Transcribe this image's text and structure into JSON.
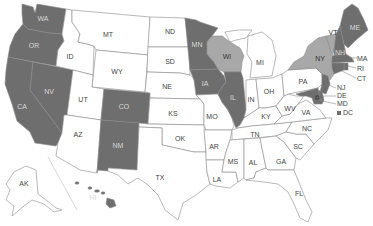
{
  "map": {
    "title": "",
    "colors": {
      "dark": "#6e6e6e",
      "light": "#a8a8a8",
      "none": "#ffffff",
      "label_on_dark": "#d8d8d8",
      "label_on_light": "#333333",
      "label_on_white": "#444444"
    },
    "legend": [],
    "states": [
      {
        "abbr": "WA",
        "shade": "dark"
      },
      {
        "abbr": "OR",
        "shade": "dark"
      },
      {
        "abbr": "CA",
        "shade": "dark"
      },
      {
        "abbr": "NV",
        "shade": "dark"
      },
      {
        "abbr": "ID",
        "shade": "none"
      },
      {
        "abbr": "MT",
        "shade": "none"
      },
      {
        "abbr": "WY",
        "shade": "none"
      },
      {
        "abbr": "UT",
        "shade": "none"
      },
      {
        "abbr": "AZ",
        "shade": "none"
      },
      {
        "abbr": "CO",
        "shade": "dark"
      },
      {
        "abbr": "NM",
        "shade": "dark"
      },
      {
        "abbr": "ND",
        "shade": "none"
      },
      {
        "abbr": "SD",
        "shade": "none"
      },
      {
        "abbr": "NE",
        "shade": "none"
      },
      {
        "abbr": "KS",
        "shade": "none"
      },
      {
        "abbr": "OK",
        "shade": "none"
      },
      {
        "abbr": "TX",
        "shade": "none"
      },
      {
        "abbr": "MN",
        "shade": "dark"
      },
      {
        "abbr": "IA",
        "shade": "dark"
      },
      {
        "abbr": "MO",
        "shade": "none"
      },
      {
        "abbr": "AR",
        "shade": "none"
      },
      {
        "abbr": "LA",
        "shade": "none"
      },
      {
        "abbr": "WI",
        "shade": "light"
      },
      {
        "abbr": "IL",
        "shade": "dark"
      },
      {
        "abbr": "MI",
        "shade": "none"
      },
      {
        "abbr": "IN",
        "shade": "none"
      },
      {
        "abbr": "OH",
        "shade": "none"
      },
      {
        "abbr": "KY",
        "shade": "none"
      },
      {
        "abbr": "TN",
        "shade": "none"
      },
      {
        "abbr": "MS",
        "shade": "none"
      },
      {
        "abbr": "AL",
        "shade": "none"
      },
      {
        "abbr": "GA",
        "shade": "none"
      },
      {
        "abbr": "FL",
        "shade": "none"
      },
      {
        "abbr": "SC",
        "shade": "none"
      },
      {
        "abbr": "NC",
        "shade": "none"
      },
      {
        "abbr": "VA",
        "shade": "none"
      },
      {
        "abbr": "WV",
        "shade": "none"
      },
      {
        "abbr": "PA",
        "shade": "none"
      },
      {
        "abbr": "NY",
        "shade": "light"
      },
      {
        "abbr": "VT",
        "shade": "light"
      },
      {
        "abbr": "NH",
        "shade": "dark"
      },
      {
        "abbr": "ME",
        "shade": "dark"
      },
      {
        "abbr": "MA",
        "shade": "dark"
      },
      {
        "abbr": "RI",
        "shade": "dark"
      },
      {
        "abbr": "CT",
        "shade": "dark"
      },
      {
        "abbr": "NJ",
        "shade": "dark"
      },
      {
        "abbr": "DE",
        "shade": "dark"
      },
      {
        "abbr": "MD",
        "shade": "dark"
      },
      {
        "abbr": "DC",
        "shade": "dark"
      },
      {
        "abbr": "AK",
        "shade": "none"
      },
      {
        "abbr": "HI",
        "shade": "dark"
      }
    ],
    "labels": {
      "WA": "WA",
      "OR": "OR",
      "CA": "CA",
      "NV": "NV",
      "ID": "ID",
      "MT": "MT",
      "WY": "WY",
      "UT": "UT",
      "AZ": "AZ",
      "CO": "CO",
      "NM": "NM",
      "ND": "ND",
      "SD": "SD",
      "NE": "NE",
      "KS": "KS",
      "OK": "OK",
      "TX": "TX",
      "MN": "MN",
      "IA": "IA",
      "MO": "MO",
      "AR": "AR",
      "LA": "LA",
      "WI": "WI",
      "IL": "IL",
      "MI": "MI",
      "IN": "IN",
      "OH": "OH",
      "KY": "KY",
      "TN": "TN",
      "MS": "MS",
      "AL": "AL",
      "GA": "GA",
      "FL": "FL",
      "SC": "SC",
      "NC": "NC",
      "VA": "VA",
      "WV": "WV",
      "PA": "PA",
      "NY": "NY",
      "VT": "VT",
      "NH": "NH",
      "ME": "ME",
      "MA": "MA",
      "RI": "RI",
      "CT": "CT",
      "NJ": "NJ",
      "DE": "DE",
      "MD": "MD",
      "DC": "DC",
      "AK": "AK",
      "HI": "HI"
    }
  }
}
